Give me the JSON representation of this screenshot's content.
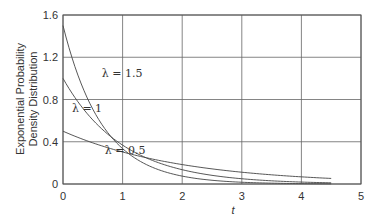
{
  "chart_data": {
    "type": "line",
    "title": "",
    "xlabel": "t",
    "ylabel": "Exponential Probability Density Distribution",
    "ylabel_lines": [
      "Exponential Probability",
      "Density Distribution"
    ],
    "xlim": [
      0,
      5
    ],
    "ylim": [
      0,
      1.6
    ],
    "x_ticks": [
      "0",
      "1",
      "2",
      "3",
      "4",
      "5"
    ],
    "y_ticks": [
      "0",
      "0.4",
      "0.8",
      "1.2",
      "1.6"
    ],
    "grid": true,
    "legend_position": "inline annotations",
    "x_range_plotted": [
      0,
      4.5
    ],
    "function": "f(t) = λ·exp(-λ·t)",
    "series": [
      {
        "name": "λ = 1.5",
        "lambda": 1.5,
        "x": [
          0,
          0.5,
          1,
          1.5,
          2,
          2.5,
          3,
          3.5,
          4,
          4.5
        ],
        "values": [
          1.5,
          0.71,
          0.33,
          0.16,
          0.07,
          0.04,
          0.02,
          0.01,
          0.004,
          0.002
        ]
      },
      {
        "name": "λ = 1",
        "lambda": 1,
        "x": [
          0,
          0.5,
          1,
          1.5,
          2,
          2.5,
          3,
          3.5,
          4,
          4.5
        ],
        "values": [
          1.0,
          0.61,
          0.37,
          0.22,
          0.14,
          0.08,
          0.05,
          0.03,
          0.02,
          0.01
        ]
      },
      {
        "name": "λ = 0.5",
        "lambda": 0.5,
        "x": [
          0,
          0.5,
          1,
          1.5,
          2,
          2.5,
          3,
          3.5,
          4,
          4.5
        ],
        "values": [
          0.5,
          0.39,
          0.3,
          0.24,
          0.18,
          0.14,
          0.11,
          0.09,
          0.07,
          0.05
        ]
      }
    ],
    "annotations": [
      {
        "text": "λ = 1.5",
        "x": 0.65,
        "y": 1.05
      },
      {
        "text": "λ = 1",
        "x": 0.15,
        "y": 0.72
      },
      {
        "text": "λ = 0.5",
        "x": 0.7,
        "y": 0.32
      }
    ]
  }
}
